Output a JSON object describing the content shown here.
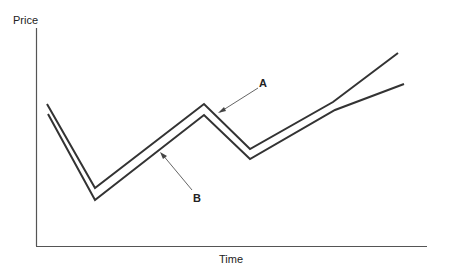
{
  "chart_data": {
    "type": "line",
    "title": "",
    "xlabel": "Time",
    "ylabel": "Price",
    "grid": false,
    "legend": "none",
    "annotations": [
      {
        "text": "A",
        "points_to": "upper line (A)"
      },
      {
        "text": "B",
        "points_to": "lower line (B)"
      }
    ],
    "series": [
      {
        "name": "A",
        "points": [
          [
            47,
            104
          ],
          [
            95,
            188
          ],
          [
            204,
            104
          ],
          [
            250,
            149
          ],
          [
            333,
            102
          ],
          [
            398,
            53
          ]
        ]
      },
      {
        "name": "B",
        "points": [
          [
            48,
            114
          ],
          [
            95,
            200
          ],
          [
            204,
            115
          ],
          [
            250,
            159
          ],
          [
            335,
            110
          ],
          [
            404,
            84
          ]
        ]
      }
    ]
  },
  "labels": {
    "ylabel": "Price",
    "xlabel": "Time",
    "a": "A",
    "b": "B"
  },
  "colors": {
    "line": "#333333",
    "axis": "#555555"
  }
}
